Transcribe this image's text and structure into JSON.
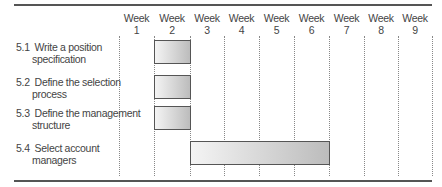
{
  "chart_data": {
    "type": "gantt",
    "title": "",
    "columns": [
      "Week 1",
      "Week 2",
      "Week 3",
      "Week 4",
      "Week 5",
      "Week 6",
      "Week 7",
      "Week 8",
      "Week 9"
    ],
    "tasks": [
      {
        "id": "5.1",
        "label": "Write a position specification",
        "line1": "Write a position",
        "line2": "specification",
        "start_week": 2,
        "end_week": 2
      },
      {
        "id": "5.2",
        "label": "Define the selection process",
        "line1": "Define the selection",
        "line2": "process",
        "start_week": 2,
        "end_week": 2
      },
      {
        "id": "5.3",
        "label": "Define the management structure",
        "line1": "Define the management",
        "line2": "structure",
        "start_week": 2,
        "end_week": 2
      },
      {
        "id": "5.4",
        "label": "Select account managers",
        "line1": "Select account",
        "line2": "managers",
        "start_week": 3,
        "end_week": 6
      }
    ],
    "grid": "dotted vertical",
    "bar_fill": "gradient light-to-grey"
  },
  "weeks": [
    {
      "w": "Week",
      "n": "1"
    },
    {
      "w": "Week",
      "n": "2"
    },
    {
      "w": "Week",
      "n": "3"
    },
    {
      "w": "Week",
      "n": "4"
    },
    {
      "w": "Week",
      "n": "5"
    },
    {
      "w": "Week",
      "n": "6"
    },
    {
      "w": "Week",
      "n": "7"
    },
    {
      "w": "Week",
      "n": "8"
    },
    {
      "w": "Week",
      "n": "9"
    }
  ]
}
